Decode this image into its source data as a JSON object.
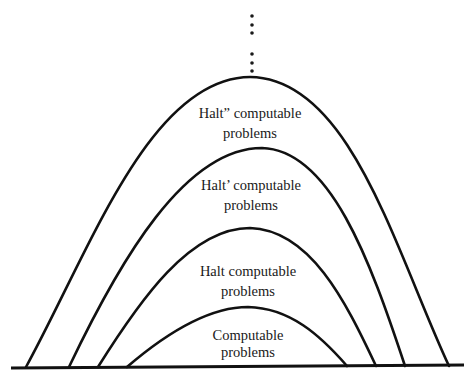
{
  "diagram": {
    "regions": [
      {
        "id": "halt2",
        "line1": "Halt” computable",
        "line2": "problems"
      },
      {
        "id": "halt1",
        "line1": "Halt’ computable",
        "line2": "problems"
      },
      {
        "id": "halt0",
        "line1": "Halt computable",
        "line2": "problems"
      },
      {
        "id": "computable",
        "line1": "Computable",
        "line2": "problems"
      }
    ],
    "continuation": "vertical ellipsis (⋮ ⋮) above outermost region",
    "colors": {
      "stroke": "#111111",
      "background": "#ffffff",
      "text": "#1a1a1a"
    }
  }
}
